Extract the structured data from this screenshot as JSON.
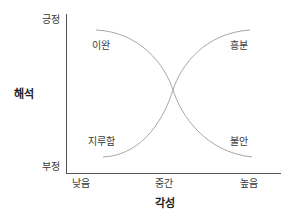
{
  "diagram": {
    "type": "arousal-interpretation-diagram",
    "y_axis": {
      "title": "해석",
      "top_label": "긍정",
      "bottom_label": "부정"
    },
    "x_axis": {
      "title": "각성",
      "ticks": [
        "낮음",
        "중간",
        "높음"
      ]
    },
    "regions": {
      "top_left": "이완",
      "top_right": "흥분",
      "bottom_left": "지루함",
      "bottom_right": "불안"
    },
    "curves": [
      {
        "name": "relaxation-to-anxiety",
        "from": "이완",
        "to": "불안"
      },
      {
        "name": "boredom-to-excitement",
        "from": "지루함",
        "to": "흥분"
      }
    ],
    "colors": {
      "axis": "#555555",
      "curve": "#a8a8a8",
      "text": "#333333"
    }
  }
}
